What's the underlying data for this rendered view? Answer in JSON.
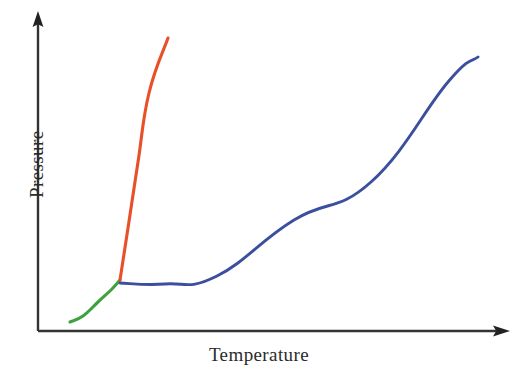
{
  "chart_data": {
    "type": "line",
    "title": "",
    "subtitle": "",
    "xlabel": "Temperature",
    "ylabel": "Pressure",
    "grid": false,
    "legend": false,
    "legend_position": "none",
    "axis_style": "arrow-headed open axes, no tick marks, no tick labels",
    "xlim": [
      0,
      1
    ],
    "ylim": [
      0,
      1
    ],
    "axis_color": "#333333",
    "background": "#ffffff",
    "annotations": [],
    "series": [
      {
        "name": "sublimation-curve",
        "color": "#3EA33E",
        "x": [
          0.068,
          0.094,
          0.124,
          0.152,
          0.174
        ],
        "y": [
          0.028,
          0.042,
          0.073,
          0.116,
          0.16
        ],
        "points_px": [
          [
            70,
            322
          ],
          [
            83,
            316
          ],
          [
            98,
            302
          ],
          [
            112,
            289
          ],
          [
            120,
            280
          ]
        ],
        "description": "solid-gas boundary rising from lower left to the triple point"
      },
      {
        "name": "fusion-curve",
        "color": "#E8502A",
        "x": [
          0.174,
          0.194,
          0.219,
          0.247,
          0.275
        ],
        "y": [
          0.16,
          0.33,
          0.545,
          0.77,
          0.917
        ],
        "points_px": [
          [
            120,
            280
          ],
          [
            128,
            228
          ],
          [
            138,
            162
          ],
          [
            149,
            93
          ],
          [
            168,
            38
          ]
        ],
        "description": "solid-liquid boundary, steep nearly vertical line from triple point upward"
      },
      {
        "name": "vaporization-curve",
        "color": "#3B4F9E",
        "x": [
          0.174,
          0.262,
          0.363,
          0.512,
          0.662,
          0.812,
          0.932
        ],
        "y": [
          0.153,
          0.15,
          0.175,
          0.258,
          0.383,
          0.545,
          0.7
        ],
        "points_px": [
          [
            120,
            283
          ],
          [
            165,
            284
          ],
          [
            217,
            276
          ],
          [
            294,
            220
          ],
          [
            371,
            182
          ],
          [
            448,
            82
          ],
          [
            478,
            57
          ]
        ],
        "description": "liquid-gas boundary from the triple point rising to the critical point"
      }
    ],
    "key_points": [
      {
        "name": "triple-point",
        "x_px": 120,
        "y_px": 280
      },
      {
        "name": "critical-point",
        "x_px": 478,
        "y_px": 57
      }
    ]
  },
  "axes": {
    "y": {
      "label": "Pressure",
      "x_px": 38,
      "y_top_px": 12,
      "y_bottom_px": 331,
      "arrow": "up"
    },
    "x": {
      "label": "Temperature",
      "y_px": 331,
      "x_left_px": 38,
      "x_right_px": 510,
      "arrow": "right"
    }
  },
  "colors": {
    "axis": "#333333",
    "sublimation": "#3EA33E",
    "fusion": "#E8502A",
    "vaporization": "#3B4F9E",
    "label_text": "#2b2b2b",
    "background": "#ffffff"
  }
}
